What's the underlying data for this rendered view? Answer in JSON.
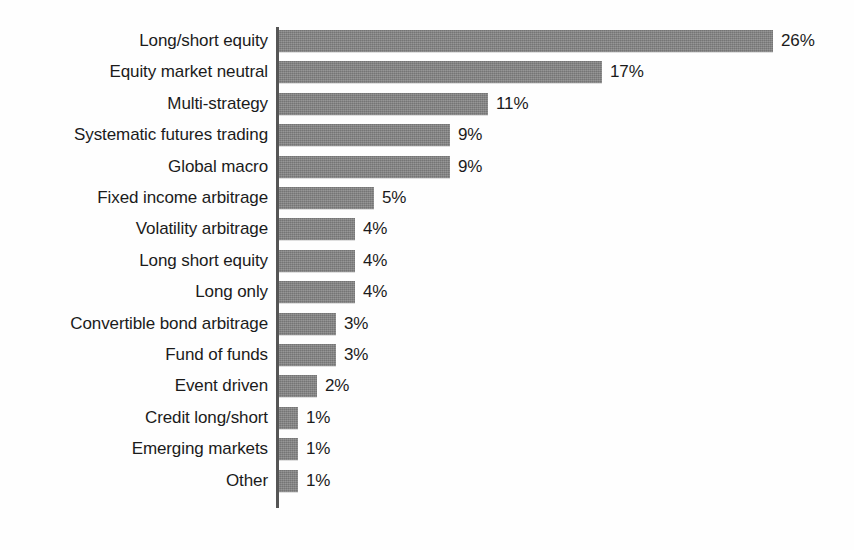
{
  "chart_data": {
    "type": "bar",
    "orientation": "horizontal",
    "title": "",
    "subtitle": "",
    "xlabel": "",
    "ylabel": "",
    "grid": false,
    "legend": null,
    "legend_position": "none",
    "axis_range": [
      0,
      26
    ],
    "value_suffix": "%",
    "bar_color": "#808080",
    "text_color": "#1b1b1b",
    "axis_color": "#555555",
    "background_color": "#fefefe",
    "categories": [
      "Long/short equity",
      "Equity market neutral",
      "Multi-strategy",
      "Systematic futures trading",
      "Global macro",
      "Fixed income arbitrage",
      "Volatility arbitrage",
      "Long short equity",
      "Long only",
      "Convertible bond arbitrage",
      "Fund of funds",
      "Event driven",
      "Credit long/short",
      "Emerging markets",
      "Other"
    ],
    "values": [
      26,
      17,
      11,
      9,
      9,
      5,
      4,
      4,
      4,
      3,
      3,
      2,
      1,
      1,
      1
    ],
    "value_labels": [
      "26%",
      "17%",
      "11%",
      "9%",
      "9%",
      "5%",
      "4%",
      "4%",
      "4%",
      "3%",
      "3%",
      "2%",
      "1%",
      "1%",
      "1%"
    ]
  }
}
